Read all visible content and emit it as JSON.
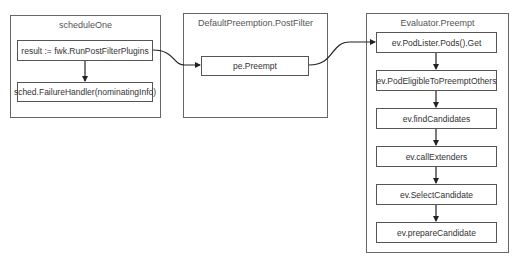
{
  "containers": {
    "schedule_one": {
      "title": "scheduleOne",
      "nodes": [
        "result := fwk.RunPostFilterPlugins",
        "sched.FailureHandler(nominatingInfo)"
      ]
    },
    "default_preemption": {
      "title": "DefaultPreemption.PostFilter",
      "nodes": [
        "pe.Preempt"
      ]
    },
    "evaluator_preempt": {
      "title": "Evaluator.Preempt",
      "nodes": [
        "ev.PodLister.Pods().Get",
        "ev.PodEligibleToPreemptOthers",
        "ev.findCandidates",
        "ev.callExtenders",
        "ev.SelectCandidate",
        "ev.prepareCandidate"
      ]
    }
  },
  "colors": {
    "border": "#555555",
    "text": "#333333",
    "edge": "#222222"
  }
}
